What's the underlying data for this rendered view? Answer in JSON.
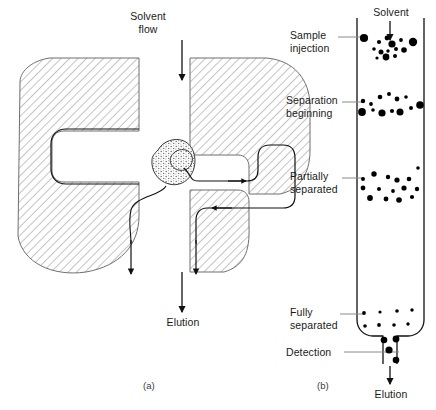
{
  "figure": {
    "width": 436,
    "height": 410,
    "background": "#ffffff",
    "ink": "#000000",
    "hatch_color": "#808080",
    "stipple_color": "#7a7a7a"
  },
  "panel_a": {
    "tag": "(a)",
    "tag_x": 148,
    "tag_y": 382,
    "top_label": "Solvent\nflow",
    "top_label_x": 148,
    "top_label_y": 10,
    "bottom_label": "Elution",
    "bottom_label_x": 148,
    "bottom_label_y": 316,
    "top_arrow": {
      "x": 182,
      "y1": 40,
      "y2": 80
    },
    "bottom_arrow": {
      "x": 182,
      "y1": 272,
      "y2": 310
    },
    "left_block": {
      "name": "stationary-phase-particle-left",
      "path": "M 20 82 C 20 70 34 60 50 58 L 139 58 L 139 131 L 64 131 C 56 131 52 136 52 143 L 52 170 C 52 177 56 182 64 182 L 139 182 L 139 216 C 139 245 120 266 86 272 C 52 277 22 262 18 236 Z"
    },
    "right_block": {
      "name": "stationary-phase-particle-right",
      "path": "M 190 58 L 266 58 C 292 60 308 78 308 104 L 308 150 C 308 176 296 190 278 194 L 247 194 L 247 167 C 247 160 243 155 236 155 L 190 155 Z M 190 188 L 236 188 C 243 188 247 193 247 200 L 247 222 C 247 248 236 264 216 270 L 190 270 Z"
    },
    "analyte_blob_large": {
      "name": "analyte-molecule-large",
      "path": "M 160 147 C 167 140 179 139 186 145 C 193 151 194 163 190 172 C 186 181 175 185 166 182 C 157 179 152 169 153 159 C 154 153 156 150 160 147 Z"
    },
    "analyte_blob_small": {
      "name": "analyte-molecule-small",
      "path": "M 176 153 C 181 150 187 151 190 155 C 193 159 192 165 188 168 C 184 171 178 170 175 166 C 172 162 173 156 176 153 Z"
    },
    "flow_path_left": "M 139 131 L 64 131 C 56 131 52 136 52 143 L 52 170 C 52 177 56 182 64 182 L 139 182",
    "flow_path_left_tail": "M 171 185 C 168 196 133 198 130 212 C 127 225 130 232 130 246 L 130 272",
    "flow_path_right_in": "M 186 164 C 196 171 193 180 200 182 L 247 182 C 254 182 258 177 258 170 L 258 155 C 258 148 262 144 269 144 L 283 144 C 290 144 294 148 294 155 L 294 196 C 294 203 290 207 283 207 L 208 207 C 201 207 197 211 197 218 L 197 272",
    "flow_arrows": [
      {
        "name": "flow-arrow-right",
        "x": 243,
        "y": 182,
        "dir": "right"
      },
      {
        "name": "flow-arrow-left",
        "x": 212,
        "y": 207,
        "dir": "left"
      }
    ],
    "exit_arrow_left": {
      "x": 130,
      "y1": 246,
      "y2": 272
    },
    "exit_arrow_right": {
      "x": 197,
      "y1": 246,
      "y2": 272
    }
  },
  "panel_b": {
    "tag": "(b)",
    "tag_x": 322,
    "tag_y": 382,
    "top_label": "Solvent",
    "top_label_x": 390,
    "top_label_y": 8,
    "bottom_label": "Elution",
    "bottom_label_x": 390,
    "bottom_label_y": 391,
    "inlet_arrow": {
      "x": 390,
      "y1": 22,
      "y2": 38
    },
    "outlet_arrow": {
      "x": 390,
      "y1": 366,
      "y2": 382
    },
    "column": {
      "name": "chromatography-column",
      "left": 357,
      "right": 424,
      "top": 18,
      "body_bottom": 333,
      "outlet_left": 383,
      "outlet_right": 397,
      "outlet_bottom": 364,
      "corner_radius": 13
    },
    "stages": [
      {
        "name": "sample-injection",
        "label": "Sample\ninjection",
        "label_x": 292,
        "label_y": 30,
        "leader": {
          "x1": 338,
          "x2": 362,
          "y": 37
        },
        "dots": [
          {
            "x": 364,
            "y": 38,
            "r": 4.1
          },
          {
            "x": 379,
            "y": 42,
            "r": 2.1
          },
          {
            "x": 387,
            "y": 38,
            "r": 2.4
          },
          {
            "x": 392,
            "y": 44,
            "r": 3.6
          },
          {
            "x": 401,
            "y": 40,
            "r": 1.9
          },
          {
            "x": 413,
            "y": 42,
            "r": 4.2
          },
          {
            "x": 374,
            "y": 49,
            "r": 1.8
          },
          {
            "x": 381,
            "y": 52,
            "r": 2.5
          },
          {
            "x": 388,
            "y": 51,
            "r": 1.7
          },
          {
            "x": 396,
            "y": 49,
            "r": 2.0
          },
          {
            "x": 404,
            "y": 50,
            "r": 2.8
          },
          {
            "x": 386,
            "y": 57,
            "r": 3.4
          },
          {
            "x": 395,
            "y": 56,
            "r": 2.0
          },
          {
            "x": 377,
            "y": 58,
            "r": 1.6
          }
        ]
      },
      {
        "name": "separation-beginning",
        "label": "Separation\nbeginning",
        "label_x": 288,
        "label_y": 95,
        "leader": {
          "x1": 342,
          "x2": 362,
          "y": 102
        },
        "dots": [
          {
            "x": 363,
            "y": 101,
            "r": 2.2
          },
          {
            "x": 371,
            "y": 104,
            "r": 1.9
          },
          {
            "x": 380,
            "y": 97,
            "r": 2.3
          },
          {
            "x": 389,
            "y": 94,
            "r": 2.0
          },
          {
            "x": 397,
            "y": 99,
            "r": 2.4
          },
          {
            "x": 406,
            "y": 97,
            "r": 1.8
          },
          {
            "x": 362,
            "y": 112,
            "r": 3.9
          },
          {
            "x": 373,
            "y": 110,
            "r": 1.8
          },
          {
            "x": 382,
            "y": 113,
            "r": 3.6
          },
          {
            "x": 392,
            "y": 111,
            "r": 2.1
          },
          {
            "x": 400,
            "y": 112,
            "r": 3.5
          },
          {
            "x": 411,
            "y": 108,
            "r": 2.0
          },
          {
            "x": 420,
            "y": 105,
            "r": 3.8
          }
        ]
      },
      {
        "name": "partially-separated",
        "label": "Partially\nseparated",
        "label_x": 292,
        "label_y": 170,
        "leader": {
          "x1": 342,
          "x2": 362,
          "y": 178
        },
        "dots": [
          {
            "x": 363,
            "y": 179,
            "r": 2.0
          },
          {
            "x": 374,
            "y": 174,
            "r": 2.7
          },
          {
            "x": 388,
            "y": 177,
            "r": 2.2
          },
          {
            "x": 397,
            "y": 180,
            "r": 2.6
          },
          {
            "x": 409,
            "y": 179,
            "r": 2.3
          },
          {
            "x": 418,
            "y": 168,
            "r": 1.8
          },
          {
            "x": 363,
            "y": 188,
            "r": 2.4
          },
          {
            "x": 379,
            "y": 189,
            "r": 2.0
          },
          {
            "x": 393,
            "y": 191,
            "r": 1.9
          },
          {
            "x": 404,
            "y": 188,
            "r": 2.6
          },
          {
            "x": 417,
            "y": 189,
            "r": 2.2
          },
          {
            "x": 370,
            "y": 198,
            "r": 2.9
          },
          {
            "x": 386,
            "y": 199,
            "r": 2.4
          },
          {
            "x": 399,
            "y": 200,
            "r": 2.8
          },
          {
            "x": 412,
            "y": 197,
            "r": 2.1
          }
        ]
      },
      {
        "name": "fully-separated",
        "label": "Fully\nseparated",
        "label_x": 292,
        "label_y": 307,
        "leader": {
          "x1": 340,
          "x2": 362,
          "y": 314
        },
        "dots": [
          {
            "x": 364,
            "y": 313,
            "r": 1.9
          },
          {
            "x": 380,
            "y": 312,
            "r": 1.6
          },
          {
            "x": 397,
            "y": 311,
            "r": 1.8
          },
          {
            "x": 412,
            "y": 310,
            "r": 1.7
          },
          {
            "x": 365,
            "y": 326,
            "r": 1.8
          },
          {
            "x": 379,
            "y": 325,
            "r": 1.9
          },
          {
            "x": 394,
            "y": 325,
            "r": 1.8
          },
          {
            "x": 408,
            "y": 324,
            "r": 1.7
          }
        ]
      },
      {
        "name": "detection",
        "label": "Detection",
        "label_x": 286,
        "label_y": 348,
        "leader": {
          "x1": 344,
          "x2": 384,
          "y": 352
        },
        "dots": [
          {
            "x": 384,
            "y": 340,
            "r": 3.3
          },
          {
            "x": 396,
            "y": 339,
            "r": 3.4
          },
          {
            "x": 389,
            "y": 350,
            "r": 3.6
          },
          {
            "x": 396,
            "y": 360,
            "r": 3.3
          }
        ]
      }
    ]
  }
}
